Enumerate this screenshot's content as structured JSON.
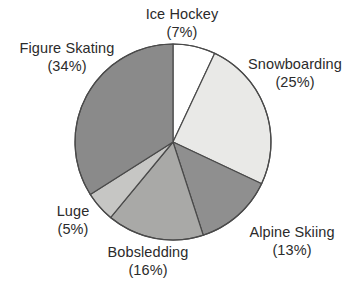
{
  "chart_data": {
    "type": "pie",
    "title": "",
    "subtitle": "",
    "xlabel": "",
    "ylabel": "",
    "legend_position": "none",
    "labels_position": "outside",
    "grid": false,
    "start_angle_deg": 0,
    "direction": "clockwise",
    "units": "percent",
    "categories": [
      "Ice Hockey",
      "Snowboarding",
      "Alpine Skiing",
      "Bobsledding",
      "Luge",
      "Figure Skating"
    ],
    "values": [
      7,
      25,
      13,
      16,
      5,
      34
    ],
    "slices": [
      {
        "name": "Ice Hockey",
        "value": 7,
        "percent_text": "(7%)",
        "color": "#ffffff",
        "start_deg": 0,
        "end_deg": 25.2
      },
      {
        "name": "Snowboarding",
        "value": 25,
        "percent_text": "(25%)",
        "color": "#e9e9e7",
        "start_deg": 25.2,
        "end_deg": 115.2
      },
      {
        "name": "Alpine Skiing",
        "value": 13,
        "percent_text": "(13%)",
        "color": "#8f8f8f",
        "start_deg": 115.2,
        "end_deg": 162.0
      },
      {
        "name": "Bobsledding",
        "value": 16,
        "percent_text": "(16%)",
        "color": "#a9a9a7",
        "start_deg": 162.0,
        "end_deg": 219.6
      },
      {
        "name": "Luge",
        "value": 5,
        "percent_text": "(5%)",
        "color": "#c6c6c4",
        "start_deg": 219.6,
        "end_deg": 237.6
      },
      {
        "name": "Figure Skating",
        "value": 34,
        "percent_text": "(34%)",
        "color": "#8a8a8a",
        "start_deg": 237.6,
        "end_deg": 360.0
      }
    ],
    "geometry": {
      "center_x": 173,
      "center_y": 142,
      "radius": 98
    },
    "style": {
      "background": "#ffffff",
      "text_color": "#2b2b2b",
      "outline_color": "#4a4a4a",
      "outline_width": 1.2
    }
  },
  "labels": {
    "ice_hockey": {
      "name": "Ice Hockey",
      "percent": "(7%)"
    },
    "snowboarding": {
      "name": "Snowboarding",
      "percent": "(25%)"
    },
    "alpine": {
      "name": "Alpine Skiing",
      "percent": "(13%)"
    },
    "bobsledding": {
      "name": "Bobsledding",
      "percent": "(16%)"
    },
    "luge": {
      "name": "Luge",
      "percent": "(5%)"
    },
    "figure": {
      "name": "Figure Skating",
      "percent": "(34%)"
    }
  }
}
